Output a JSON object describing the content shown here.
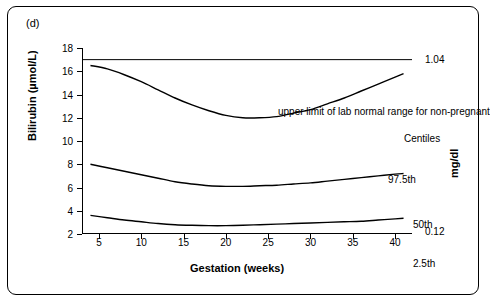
{
  "panel": {
    "label": "(d)"
  },
  "chart_data": {
    "type": "line",
    "title": "",
    "xlabel": "Gestation (weeks)",
    "ylabel": "Bilirubin (µmol/L)",
    "ylabel_right": "mg/dl",
    "xlim": [
      3,
      42
    ],
    "ylim": [
      2,
      18
    ],
    "xticks": [
      5,
      10,
      15,
      20,
      25,
      30,
      35,
      40
    ],
    "yticks": [
      2,
      4,
      6,
      8,
      10,
      12,
      14,
      16,
      18
    ],
    "grid": false,
    "legend_position": "inline-labels",
    "annotations": [
      {
        "name": "upper-limit-line",
        "text": "upper limit of lab normal range for non-pregnant",
        "y": 17.0
      },
      {
        "name": "centiles-caption",
        "text": "Centiles"
      },
      {
        "name": "right-axis-top-value",
        "text": "1.04"
      },
      {
        "name": "right-axis-bottom-value",
        "text": "0.12"
      }
    ],
    "series": [
      {
        "name": "97.5th",
        "label": "97.5th",
        "color": "#000000",
        "x": [
          4,
          6,
          8,
          10,
          12,
          14,
          16,
          18,
          20,
          22,
          24,
          26,
          28,
          30,
          32,
          34,
          36,
          38,
          40,
          41
        ],
        "values": [
          16.5,
          16.2,
          15.7,
          15.1,
          14.4,
          13.7,
          13.1,
          12.6,
          12.2,
          12.0,
          12.0,
          12.1,
          12.4,
          12.7,
          13.2,
          13.7,
          14.3,
          14.9,
          15.5,
          15.8
        ]
      },
      {
        "name": "50th",
        "label": "50th",
        "color": "#000000",
        "x": [
          4,
          6,
          8,
          10,
          12,
          14,
          16,
          18,
          20,
          22,
          24,
          26,
          28,
          30,
          32,
          34,
          36,
          38,
          40,
          41
        ],
        "values": [
          8.0,
          7.7,
          7.4,
          7.1,
          6.8,
          6.5,
          6.3,
          6.15,
          6.1,
          6.1,
          6.15,
          6.2,
          6.3,
          6.4,
          6.55,
          6.7,
          6.85,
          7.0,
          7.15,
          7.2
        ]
      },
      {
        "name": "2.5th",
        "label": "2.5th",
        "color": "#000000",
        "x": [
          4,
          6,
          8,
          10,
          12,
          14,
          16,
          18,
          20,
          22,
          24,
          26,
          28,
          30,
          32,
          34,
          36,
          38,
          40,
          41
        ],
        "values": [
          3.6,
          3.4,
          3.2,
          3.05,
          2.9,
          2.8,
          2.75,
          2.72,
          2.72,
          2.75,
          2.8,
          2.85,
          2.9,
          2.95,
          3.0,
          3.05,
          3.1,
          3.2,
          3.3,
          3.35
        ]
      }
    ],
    "reference_line": {
      "name": "upper-limit-line",
      "y": 17.0,
      "x_from": 3,
      "x_to": 42
    }
  }
}
